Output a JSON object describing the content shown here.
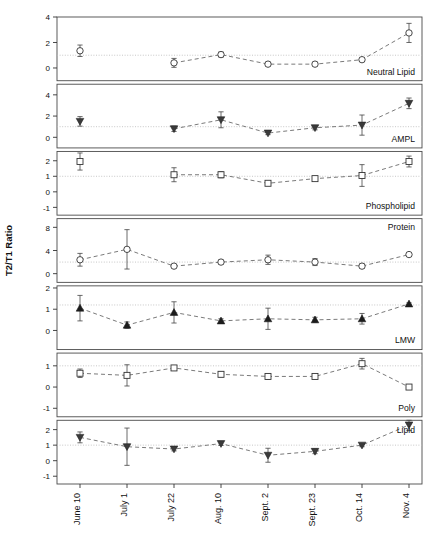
{
  "figure": {
    "ylabel": "T2/T1 Ratio",
    "xlabels": [
      "June 10",
      "July 1",
      "July 22",
      "Aug. 10",
      "Sept. 2",
      "Sept. 23",
      "Oct. 14",
      "Nov. 4"
    ]
  },
  "chart_data": {
    "type": "line",
    "title": "",
    "xlabel": "",
    "ylabel": "T2/T1 Ratio",
    "grid": true,
    "legend": "none",
    "x": [
      "June 10",
      "July 1",
      "July 22",
      "Aug. 10",
      "Sept. 2",
      "Sept. 23",
      "Oct. 14",
      "Nov. 4"
    ],
    "panels": [
      {
        "name": "Neutral Lipid",
        "marker": "open-circle",
        "ylim": [
          -1,
          4
        ],
        "yticks": [
          0,
          2,
          4
        ],
        "ytick_labels": [
          "0",
          "2",
          "4"
        ],
        "reference_line": 1,
        "first_point_detached": true,
        "values": [
          1.35,
          0.4,
          1.05,
          0.3,
          0.3,
          0.65,
          2.75
        ],
        "errors": [
          0.45,
          0.35,
          0.2,
          0.15,
          0.15,
          0.15,
          0.75
        ],
        "series": [
          {
            "name": "Neutral Lipid",
            "x": [
              "June 10",
              "July 22",
              "Aug. 10",
              "Sept. 2",
              "Sept. 23",
              "Oct. 14",
              "Nov. 4"
            ],
            "values": [
              1.35,
              0.4,
              1.05,
              0.3,
              0.3,
              0.65,
              2.75
            ],
            "errors": [
              0.45,
              0.35,
              0.2,
              0.15,
              0.15,
              0.15,
              0.75
            ]
          }
        ]
      },
      {
        "name": "AMPL",
        "marker": "filled-down-triangle",
        "ylim": [
          -1,
          5
        ],
        "yticks": [
          0,
          2,
          4
        ],
        "ytick_labels": [
          "0",
          "2",
          "4"
        ],
        "reference_line": 1,
        "first_point_detached": true,
        "values": [
          1.5,
          0.8,
          1.65,
          0.4,
          0.9,
          1.15,
          3.2
        ],
        "errors": [
          0.45,
          0.25,
          0.75,
          0.15,
          0.2,
          0.95,
          0.5
        ],
        "series": [
          {
            "name": "AMPL",
            "x": [
              "June 10",
              "July 22",
              "Aug. 10",
              "Sept. 2",
              "Sept. 23",
              "Oct. 14",
              "Nov. 4"
            ],
            "values": [
              1.5,
              0.8,
              1.65,
              0.4,
              0.9,
              1.15,
              3.2
            ],
            "errors": [
              0.45,
              0.25,
              0.75,
              0.15,
              0.2,
              0.95,
              0.5
            ]
          }
        ]
      },
      {
        "name": "Phospholipid",
        "marker": "open-square",
        "ylim": [
          -1.5,
          2.6
        ],
        "yticks": [
          -1,
          0,
          1,
          2
        ],
        "ytick_labels": [
          "-1",
          "0",
          "1",
          "2"
        ],
        "reference_line": 1,
        "first_point_detached": true,
        "values": [
          1.95,
          1.1,
          1.1,
          0.55,
          0.85,
          1.05,
          1.95
        ],
        "errors": [
          0.55,
          0.45,
          0.2,
          0.1,
          0.1,
          0.7,
          0.35
        ],
        "series": [
          {
            "name": "Phospholipid",
            "x": [
              "June 10",
              "July 22",
              "Aug. 10",
              "Sept. 2",
              "Sept. 23",
              "Oct. 14",
              "Nov. 4"
            ],
            "values": [
              1.95,
              1.1,
              1.1,
              0.55,
              0.85,
              1.05,
              1.95
            ],
            "errors": [
              0.55,
              0.45,
              0.2,
              0.1,
              0.1,
              0.7,
              0.35
            ]
          }
        ]
      },
      {
        "name": "Protein",
        "marker": "open-circle",
        "ylim": [
          -1.5,
          9.5
        ],
        "yticks": [
          0,
          4,
          8
        ],
        "ytick_labels": [
          "0",
          "4",
          "8"
        ],
        "reference_line": 2,
        "first_point_detached": false,
        "values": [
          2.4,
          4.2,
          1.3,
          2.0,
          2.4,
          2.0,
          1.3,
          3.3
        ],
        "errors": [
          1.1,
          3.4,
          0.3,
          0.35,
          0.8,
          0.6,
          0.4,
          0.15
        ],
        "series": [
          {
            "name": "Protein",
            "x": [
              "June 10",
              "July 1",
              "July 22",
              "Aug. 10",
              "Sept. 2",
              "Sept. 23",
              "Oct. 14",
              "Nov. 4"
            ],
            "values": [
              2.4,
              4.2,
              1.3,
              2.0,
              2.4,
              2.0,
              1.3,
              3.3
            ],
            "errors": [
              1.1,
              3.4,
              0.3,
              0.35,
              0.8,
              0.6,
              0.4,
              0.15
            ]
          }
        ]
      },
      {
        "name": "LMW",
        "marker": "filled-up-triangle",
        "ylim": [
          -0.9,
          2.1
        ],
        "yticks": [
          0,
          1,
          2
        ],
        "ytick_labels": [
          "0",
          "1",
          "2"
        ],
        "reference_line": 1.2,
        "first_point_detached": false,
        "values": [
          1.05,
          0.25,
          0.85,
          0.45,
          0.55,
          0.5,
          0.55,
          1.25
        ],
        "errors": [
          0.6,
          0.15,
          0.5,
          0.1,
          0.5,
          0.12,
          0.25,
          0.05
        ],
        "series": [
          {
            "name": "LMW",
            "x": [
              "June 10",
              "July 1",
              "July 22",
              "Aug. 10",
              "Sept. 2",
              "Sept. 23",
              "Oct. 14",
              "Nov. 4"
            ],
            "values": [
              1.05,
              0.25,
              0.85,
              0.45,
              0.55,
              0.5,
              0.55,
              1.25
            ],
            "errors": [
              0.6,
              0.15,
              0.5,
              0.1,
              0.5,
              0.12,
              0.25,
              0.05
            ]
          }
        ]
      },
      {
        "name": "Poly",
        "marker": "open-square",
        "ylim": [
          -1.4,
          1.6
        ],
        "yticks": [
          -1,
          0,
          1
        ],
        "ytick_labels": [
          "-1",
          "0",
          "1"
        ],
        "reference_line": 1,
        "first_point_detached": false,
        "values": [
          0.65,
          0.55,
          0.9,
          0.6,
          0.5,
          0.5,
          1.1,
          0.0
        ],
        "errors": [
          0.2,
          0.5,
          0.1,
          0.12,
          0.12,
          0.08,
          0.25,
          0.05
        ],
        "series": [
          {
            "name": "Poly",
            "x": [
              "June 10",
              "July 1",
              "July 22",
              "Aug. 10",
              "Sept. 2",
              "Sept. 23",
              "Oct. 14",
              "Nov. 4"
            ],
            "values": [
              0.65,
              0.55,
              0.9,
              0.6,
              0.5,
              0.5,
              1.1,
              0.0
            ],
            "errors": [
              0.2,
              0.5,
              0.1,
              0.12,
              0.12,
              0.08,
              0.25,
              0.05
            ]
          }
        ]
      },
      {
        "name": "Lipid",
        "marker": "filled-down-triangle",
        "ylim": [
          -1.5,
          2.6
        ],
        "yticks": [
          -1,
          0,
          1,
          2
        ],
        "ytick_labels": [
          "-1",
          "0",
          "1",
          "2"
        ],
        "reference_line": 1,
        "first_point_detached": false,
        "values": [
          1.5,
          0.9,
          0.75,
          1.1,
          0.35,
          0.6,
          1.0,
          2.3
        ],
        "errors": [
          0.35,
          1.2,
          0.12,
          0.12,
          0.45,
          0.15,
          0.1,
          0.35
        ],
        "series": [
          {
            "name": "Lipid",
            "x": [
              "June 10",
              "July 1",
              "July 22",
              "Aug. 10",
              "Sept. 2",
              "Sept. 23",
              "Oct. 14",
              "Nov. 4"
            ],
            "values": [
              1.5,
              0.9,
              0.75,
              1.1,
              0.35,
              0.6,
              1.0,
              2.3
            ],
            "errors": [
              0.35,
              1.2,
              0.12,
              0.12,
              0.45,
              0.15,
              0.1,
              0.35
            ]
          }
        ]
      }
    ]
  }
}
